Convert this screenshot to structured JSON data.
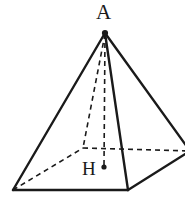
{
  "figure": {
    "kind": "geometry-diagram",
    "background_color": "#ffffff",
    "stroke_color": "#1a1a1a",
    "solid_stroke_width": 2.4,
    "dashed_stroke_width": 1.6,
    "dash_pattern": "5,4",
    "canvas": {
      "width": 185,
      "height": 213
    },
    "labels": [
      {
        "id": "apex",
        "text": "A",
        "x": 96,
        "y": 2,
        "font_size": 21
      },
      {
        "id": "height-foot",
        "text": "H",
        "x": 82,
        "y": 159,
        "font_size": 19
      }
    ],
    "points": {
      "apex": {
        "name": "A",
        "x": 105,
        "y": 33
      },
      "base_front_left": {
        "name": "front-left",
        "x": 13,
        "y": 190
      },
      "base_front_right": {
        "name": "front-right",
        "x": 128,
        "y": 190
      },
      "base_back_right": {
        "name": "back-right",
        "x": 190,
        "y": 151
      },
      "base_back_left": {
        "name": "back-left",
        "x": 83,
        "y": 148
      },
      "center": {
        "name": "H",
        "x": 105,
        "y": 167
      }
    },
    "solid_edges": [
      {
        "name": "apex-to-front-left-edge",
        "from": "apex",
        "to": "base_front_left"
      },
      {
        "name": "apex-to-front-right-edge",
        "from": "apex",
        "to": "base_front_right"
      },
      {
        "name": "apex-to-back-right-edge",
        "from": "apex",
        "to": "base_back_right"
      },
      {
        "name": "base-front-edge",
        "from": "base_front_left",
        "to": "base_front_right"
      },
      {
        "name": "base-right-edge",
        "from": "base_front_right",
        "to": "base_back_right"
      }
    ],
    "dashed_edges": [
      {
        "name": "apex-to-back-left-hidden-edge",
        "from": "apex",
        "to": "base_back_left"
      },
      {
        "name": "base-back-left-hidden-edge",
        "from": "base_front_left",
        "to": "base_back_left"
      },
      {
        "name": "base-back-right-hidden-edge",
        "from": "base_back_left",
        "to": "base_back_right"
      },
      {
        "name": "altitude-apex-to-center",
        "from": "apex",
        "to": "center"
      }
    ],
    "dots": [
      {
        "name": "apex-dot",
        "x": 105,
        "y": 33,
        "r": 3.1
      },
      {
        "name": "center-dot",
        "x": 104,
        "y": 167,
        "r": 2.6
      }
    ]
  }
}
